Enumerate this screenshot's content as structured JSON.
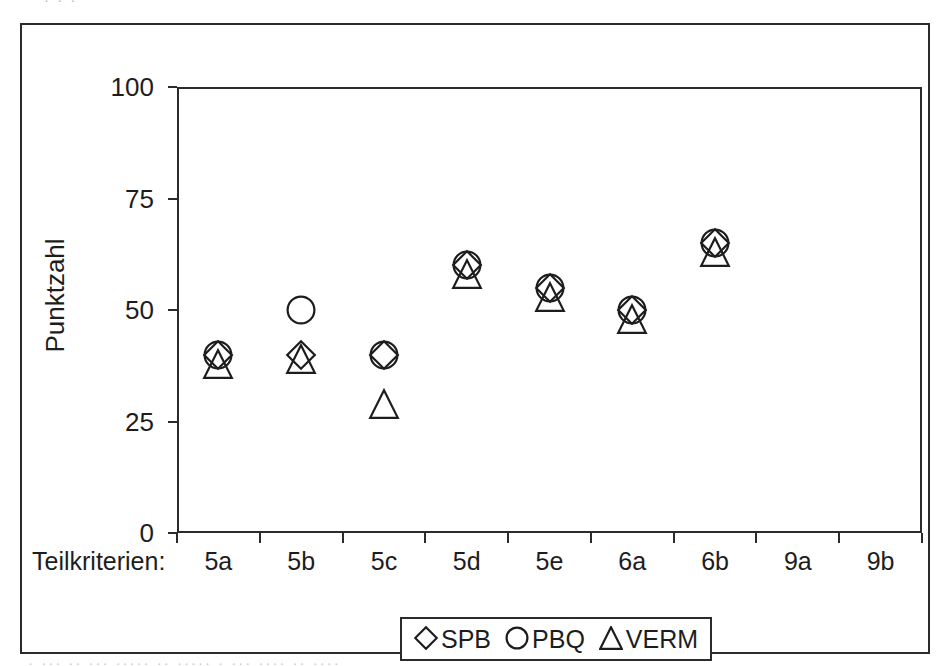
{
  "figure": {
    "scan_artifact_top": "·  ·          ·",
    "scan_artifact_bottom": "· ··· ··  ···  ····· ·· ·····  · ··· ···· ··  ····",
    "frame_color": "#2b2b2b",
    "background": "#ffffff",
    "ink_color": "#1d1d1d"
  },
  "chart_data": {
    "type": "scatter",
    "title": "",
    "xlabel": "Teilkriterien:",
    "ylabel": "Punktzahl",
    "categories": [
      "5a",
      "5b",
      "5c",
      "5d",
      "5e",
      "6a",
      "6b",
      "9a",
      "9b"
    ],
    "ylim": [
      0,
      100
    ],
    "yticks": [
      0,
      25,
      50,
      75,
      100
    ],
    "ytick_labels": [
      "0",
      "25",
      "50",
      "75",
      "100"
    ],
    "grid": false,
    "legend_position": "bottom-center",
    "series": [
      {
        "name": "SPB",
        "marker": "diamond",
        "values": [
          40,
          40,
          40,
          60,
          55,
          50,
          65,
          null,
          null
        ]
      },
      {
        "name": "PBQ",
        "marker": "circle",
        "values": [
          40,
          50,
          40,
          60,
          55,
          50,
          65,
          null,
          null
        ]
      },
      {
        "name": "VERM",
        "marker": "triangle",
        "values": [
          38,
          39,
          29,
          58,
          53,
          48,
          63,
          null,
          null
        ]
      }
    ]
  },
  "legend": {
    "entries": [
      {
        "label": "SPB",
        "marker": "diamond",
        "icon": "diamond-icon"
      },
      {
        "label": "PBQ",
        "marker": "circle",
        "icon": "circle-icon"
      },
      {
        "label": "VERM",
        "marker": "triangle",
        "icon": "triangle-icon"
      }
    ]
  }
}
